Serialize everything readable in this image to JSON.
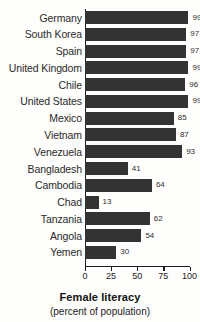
{
  "chart_data": {
    "type": "bar",
    "orientation": "horizontal",
    "title": "Female literacy",
    "subtitle": "(percent of population)",
    "xlabel": "",
    "ylabel": "",
    "xlim": [
      0,
      100
    ],
    "xticks": [
      0,
      25,
      50,
      75,
      100
    ],
    "xtick_labels": [
      "0",
      "25",
      "50",
      "75",
      "100"
    ],
    "grid": false,
    "legend": false,
    "bar_color": "#333333",
    "background_color": "#fdfdfb",
    "value_labels_shown": true,
    "categories": [
      "Germany",
      "South Korea",
      "Spain",
      "United Kingdom",
      "Chile",
      "United States",
      "Mexico",
      "Vietnam",
      "Venezuela",
      "Bangladesh",
      "Cambodia",
      "Chad",
      "Tanzania",
      "Angola",
      "Yemen"
    ],
    "values": [
      99,
      97,
      97,
      99,
      96,
      99,
      85,
      87,
      93,
      41,
      64,
      13,
      62,
      54,
      30
    ]
  }
}
